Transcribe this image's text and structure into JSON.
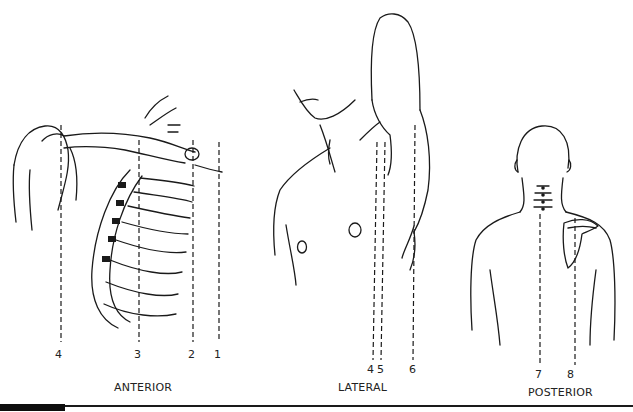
{
  "figure": {
    "panels": [
      {
        "id": "anterior",
        "label": "ANTERIOR",
        "subject": "clavicle, shoulder, rib cage (anterior view)"
      },
      {
        "id": "lateral",
        "label": "LATERAL",
        "subject": "chest and raised arm (lateral view)"
      },
      {
        "id": "posterior",
        "label": "POSTERIOR",
        "subject": "back with cervical vertebrae and scapula (posterior view)"
      }
    ],
    "line_numbers": {
      "anterior": [
        "4",
        "3",
        "2",
        "1"
      ],
      "lateral": [
        "4",
        "5",
        "6"
      ],
      "posterior": [
        "7",
        "8"
      ]
    }
  }
}
